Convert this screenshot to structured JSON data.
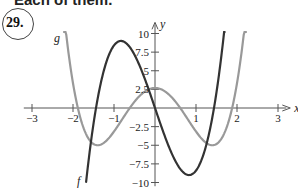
{
  "page": {
    "heading": "Each of them.",
    "problem_number": "29."
  },
  "chart_data": {
    "type": "line",
    "title": "",
    "xlabel": "x",
    "ylabel": "y",
    "xlim": [
      -3.2,
      3.3
    ],
    "ylim": [
      -10.5,
      11.5
    ],
    "x_ticks": [
      -3,
      -2,
      -1,
      1,
      2,
      3
    ],
    "x_tick_labels": [
      "−3",
      "−2",
      "−1",
      "1",
      "2",
      "3"
    ],
    "y_ticks": [
      10,
      7.5,
      5,
      2.5,
      -2.5,
      -5,
      -7.5,
      -10
    ],
    "y_tick_labels": [
      "10",
      "7.5",
      "5",
      "2.5",
      "−2.5",
      "−5",
      "−7.5",
      "−10"
    ],
    "grid": false,
    "legend": "curve labels placed near curve ends",
    "series": [
      {
        "name": "f",
        "color": "#333333",
        "description": "cubic-like curve: local max ≈ 9 at x ≈ −0.85, passes through origin, local min ≈ −9 at x ≈ 0.85, zeros near ±1.44",
        "x": [
          -1.68,
          -1.5,
          -1.44,
          -1.2,
          -1.0,
          -0.85,
          -0.6,
          -0.3,
          0,
          0.3,
          0.6,
          0.85,
          1.0,
          1.2,
          1.44,
          1.5,
          1.7
        ],
        "y": [
          -10,
          -2.2,
          0,
          7.2,
          8.5,
          9.0,
          8.1,
          4.7,
          0,
          -4.7,
          -8.1,
          -9.0,
          -8.5,
          -7.2,
          0,
          2.2,
          10
        ]
      },
      {
        "name": "g",
        "color": "#999999",
        "description": "even quartic-like curve: local max ≈ 2.7 at x = 0, minima ≈ −5 at x ≈ ±1.4, zeros near ±0.62 and ±1.9",
        "x": [
          -2.22,
          -2.0,
          -1.9,
          -1.7,
          -1.4,
          -1.2,
          -1.0,
          -0.62,
          -0.3,
          0,
          0.3,
          0.62,
          1.0,
          1.2,
          1.4,
          1.7,
          1.9,
          2.0,
          2.22
        ],
        "y": [
          10,
          2.1,
          0,
          -3.4,
          -5.0,
          -4.8,
          -3.2,
          0,
          2.2,
          2.7,
          2.2,
          0,
          -3.2,
          -4.8,
          -5.0,
          -3.4,
          0,
          2.1,
          10
        ]
      }
    ]
  }
}
